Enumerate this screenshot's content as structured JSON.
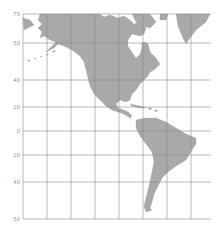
{
  "map": {
    "title": "",
    "projection": "Mercator",
    "region": "The Americas",
    "colors": {
      "land": "#a9a9a9",
      "grid": "#8a8a8a",
      "label": "#9a9a9a",
      "background": "#ffffff"
    },
    "frame": {
      "left": 23,
      "right": 211,
      "top": 14,
      "bottom": 219
    },
    "latitude_lines": [
      {
        "label": "70",
        "y": 14
      },
      {
        "label": "60",
        "y": 43
      },
      {
        "label": "40",
        "y": 80
      },
      {
        "label": "20",
        "y": 107
      },
      {
        "label": "0",
        "y": 131
      },
      {
        "label": "20",
        "y": 155
      },
      {
        "label": "40",
        "y": 182
      },
      {
        "label": "60",
        "y": 219
      }
    ],
    "longitude_lines_x": [
      23,
      47,
      71,
      95,
      119,
      143,
      167,
      191
    ],
    "landmasses": [
      "North America",
      "Central America",
      "South America",
      "Greenland",
      "Caribbean islands",
      "Aleutian Islands"
    ]
  }
}
